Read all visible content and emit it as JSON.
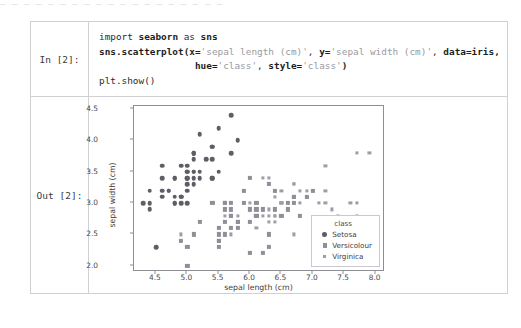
{
  "top_crop_text": "— — — — —  — — — —  — —  — — — — —  — —  —",
  "cells": {
    "input": {
      "prompt": "In [2]:",
      "code_lines": [
        [
          {
            "t": "import ",
            "c": "pl"
          },
          {
            "t": "seaborn",
            "c": "bd"
          },
          {
            "t": " as ",
            "c": "pl"
          },
          {
            "t": "sns",
            "c": "bd"
          }
        ],
        [
          {
            "t": "sns.scatterplot(",
            "c": "bd"
          },
          {
            "t": "x=",
            "c": "bd"
          },
          {
            "t": "'sepal length (cm)'",
            "c": "str"
          },
          {
            "t": ", ",
            "c": "pl"
          },
          {
            "t": "y=",
            "c": "bd"
          },
          {
            "t": "'sepal width (cm)'",
            "c": "str"
          },
          {
            "t": ", ",
            "c": "pl"
          },
          {
            "t": "data=iris,",
            "c": "bd"
          }
        ],
        [
          {
            "t": "                 ",
            "c": "pl"
          },
          {
            "t": "hue=",
            "c": "bd"
          },
          {
            "t": "'class'",
            "c": "str"
          },
          {
            "t": ", ",
            "c": "pl"
          },
          {
            "t": "style=",
            "c": "bd"
          },
          {
            "t": "'class'",
            "c": "str"
          },
          {
            "t": ")",
            "c": "bd"
          }
        ],
        [
          {
            "t": "plt.show()",
            "c": "pl"
          }
        ]
      ],
      "code_plain": "import seaborn as sns\nsns.scatterplot(x='sepal length (cm)', y='sepal width (cm)', data=iris,\n                 hue='class', style='class')\nplt.show()"
    },
    "output": {
      "prompt": "Out [2]:"
    }
  },
  "chart_data": {
    "type": "scatter",
    "title": "",
    "xlabel": "sepal length (cm)",
    "ylabel": "sepal width (cm)",
    "xlim": [
      4.15,
      8.15
    ],
    "ylim": [
      1.9,
      4.55
    ],
    "xticks": [
      "4.5",
      "5.0",
      "5.5",
      "6.0",
      "6.5",
      "7.0",
      "7.5",
      "8.0"
    ],
    "xtick_values": [
      4.5,
      5.0,
      5.5,
      6.0,
      6.5,
      7.0,
      7.5,
      8.0
    ],
    "yticks": [
      "2.0",
      "2.5",
      "3.0",
      "3.5",
      "4.0",
      "4.5"
    ],
    "ytick_values": [
      2.0,
      2.5,
      3.0,
      3.5,
      4.0,
      4.5
    ],
    "grid": false,
    "legend": {
      "title": "class",
      "position": "lower right",
      "entries": [
        {
          "label": "Setosa",
          "marker": "circle",
          "color": "#5e5e66"
        },
        {
          "label": "Versicolour",
          "marker": "square",
          "color": "#8f8f98"
        },
        {
          "label": "Virginica",
          "marker": "small-square",
          "color": "#9d9da6"
        }
      ]
    },
    "series": [
      {
        "name": "Setosa",
        "marker": "circle",
        "color": "#5e5e66",
        "points": [
          [
            5.1,
            3.5
          ],
          [
            4.9,
            3.0
          ],
          [
            4.7,
            3.2
          ],
          [
            4.6,
            3.1
          ],
          [
            5.0,
            3.6
          ],
          [
            5.4,
            3.9
          ],
          [
            4.6,
            3.4
          ],
          [
            5.0,
            3.4
          ],
          [
            4.4,
            2.9
          ],
          [
            4.9,
            3.1
          ],
          [
            5.4,
            3.7
          ],
          [
            4.8,
            3.4
          ],
          [
            4.8,
            3.0
          ],
          [
            4.3,
            3.0
          ],
          [
            5.8,
            4.0
          ],
          [
            5.7,
            4.4
          ],
          [
            5.4,
            3.9
          ],
          [
            5.1,
            3.5
          ],
          [
            5.7,
            3.8
          ],
          [
            5.1,
            3.8
          ],
          [
            5.4,
            3.4
          ],
          [
            5.1,
            3.7
          ],
          [
            4.6,
            3.6
          ],
          [
            5.1,
            3.3
          ],
          [
            4.8,
            3.4
          ],
          [
            5.0,
            3.0
          ],
          [
            5.0,
            3.4
          ],
          [
            5.2,
            3.5
          ],
          [
            5.2,
            3.4
          ],
          [
            4.7,
            3.2
          ],
          [
            4.8,
            3.1
          ],
          [
            5.4,
            3.4
          ],
          [
            5.2,
            4.1
          ],
          [
            5.5,
            4.2
          ],
          [
            4.9,
            3.1
          ],
          [
            5.0,
            3.2
          ],
          [
            5.5,
            3.5
          ],
          [
            4.9,
            3.6
          ],
          [
            4.4,
            3.0
          ],
          [
            5.1,
            3.4
          ],
          [
            5.0,
            3.5
          ],
          [
            4.5,
            2.3
          ],
          [
            4.4,
            3.2
          ],
          [
            5.0,
            3.5
          ],
          [
            5.1,
            3.8
          ],
          [
            4.8,
            3.0
          ],
          [
            5.1,
            3.8
          ],
          [
            4.6,
            3.2
          ],
          [
            5.3,
            3.7
          ],
          [
            5.0,
            3.3
          ]
        ]
      },
      {
        "name": "Versicolour",
        "marker": "square",
        "color": "#8f8f98",
        "points": [
          [
            7.0,
            3.2
          ],
          [
            6.4,
            3.2
          ],
          [
            6.9,
            3.1
          ],
          [
            5.5,
            2.3
          ],
          [
            6.5,
            2.8
          ],
          [
            5.7,
            2.8
          ],
          [
            6.3,
            3.3
          ],
          [
            4.9,
            2.4
          ],
          [
            6.6,
            2.9
          ],
          [
            5.2,
            2.7
          ],
          [
            5.0,
            2.0
          ],
          [
            5.9,
            3.0
          ],
          [
            6.0,
            2.2
          ],
          [
            6.1,
            2.9
          ],
          [
            5.6,
            2.9
          ],
          [
            6.7,
            3.1
          ],
          [
            5.6,
            3.0
          ],
          [
            5.8,
            2.7
          ],
          [
            6.2,
            2.2
          ],
          [
            5.6,
            2.5
          ],
          [
            5.9,
            3.2
          ],
          [
            6.1,
            2.8
          ],
          [
            6.3,
            2.5
          ],
          [
            6.1,
            2.8
          ],
          [
            6.4,
            2.9
          ],
          [
            6.6,
            3.0
          ],
          [
            6.8,
            2.8
          ],
          [
            6.7,
            3.0
          ],
          [
            6.0,
            2.9
          ],
          [
            5.7,
            2.6
          ],
          [
            5.5,
            2.4
          ],
          [
            5.5,
            2.4
          ],
          [
            5.8,
            2.7
          ],
          [
            6.0,
            2.7
          ],
          [
            5.4,
            3.0
          ],
          [
            6.0,
            3.4
          ],
          [
            6.7,
            3.1
          ],
          [
            6.3,
            2.3
          ],
          [
            5.6,
            3.0
          ],
          [
            5.5,
            2.5
          ],
          [
            5.5,
            2.6
          ],
          [
            6.1,
            3.0
          ],
          [
            5.8,
            2.6
          ],
          [
            5.0,
            2.3
          ],
          [
            5.6,
            2.7
          ],
          [
            5.7,
            3.0
          ],
          [
            5.7,
            2.9
          ],
          [
            6.2,
            2.9
          ],
          [
            5.1,
            2.5
          ],
          [
            5.7,
            2.8
          ]
        ]
      },
      {
        "name": "Virginica",
        "marker": "small-square",
        "color": "#9d9da6",
        "points": [
          [
            6.3,
            3.3
          ],
          [
            5.8,
            2.7
          ],
          [
            7.1,
            3.0
          ],
          [
            6.3,
            2.9
          ],
          [
            6.5,
            3.0
          ],
          [
            7.6,
            3.0
          ],
          [
            4.9,
            2.5
          ],
          [
            7.3,
            2.9
          ],
          [
            6.7,
            2.5
          ],
          [
            7.2,
            3.6
          ],
          [
            6.5,
            3.2
          ],
          [
            6.4,
            2.7
          ],
          [
            6.8,
            3.0
          ],
          [
            5.7,
            2.5
          ],
          [
            5.8,
            2.8
          ],
          [
            6.4,
            3.2
          ],
          [
            6.5,
            3.0
          ],
          [
            7.7,
            3.8
          ],
          [
            7.7,
            2.6
          ],
          [
            6.0,
            2.2
          ],
          [
            6.9,
            3.2
          ],
          [
            5.6,
            2.8
          ],
          [
            7.7,
            2.8
          ],
          [
            6.3,
            2.7
          ],
          [
            6.7,
            3.3
          ],
          [
            7.2,
            3.2
          ],
          [
            6.2,
            2.8
          ],
          [
            6.1,
            3.0
          ],
          [
            6.4,
            2.8
          ],
          [
            7.2,
            3.0
          ],
          [
            7.4,
            2.8
          ],
          [
            7.9,
            3.8
          ],
          [
            6.4,
            2.8
          ],
          [
            6.3,
            2.8
          ],
          [
            6.1,
            2.6
          ],
          [
            7.7,
            3.0
          ],
          [
            6.3,
            3.4
          ],
          [
            6.4,
            3.1
          ],
          [
            6.0,
            3.0
          ],
          [
            6.9,
            3.1
          ],
          [
            6.7,
            3.1
          ],
          [
            6.9,
            3.1
          ],
          [
            5.8,
            2.7
          ],
          [
            6.8,
            3.2
          ],
          [
            6.7,
            3.3
          ],
          [
            6.7,
            3.0
          ],
          [
            6.3,
            2.5
          ],
          [
            6.5,
            3.0
          ],
          [
            6.2,
            3.4
          ],
          [
            5.9,
            3.0
          ]
        ]
      }
    ]
  }
}
